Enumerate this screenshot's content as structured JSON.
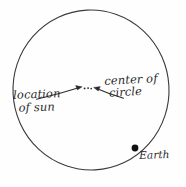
{
  "figure": {
    "background_color": "#fefefe",
    "ink_color": "#2b2b2b"
  },
  "circle": {
    "name": "orbit-circle",
    "center_x": 91,
    "center_y": 90,
    "radius_x": 78,
    "radius_y": 80,
    "stroke_color": "#3a3a3a",
    "stroke_width": 1.1
  },
  "center_marks": {
    "description": "small dots marking the geometric center / sun location",
    "dots": [
      {
        "x": 84.5,
        "y": 88.5,
        "r": 0.9
      },
      {
        "x": 88.0,
        "y": 88.2,
        "r": 0.9
      },
      {
        "x": 91.0,
        "y": 88.6,
        "r": 0.8
      }
    ]
  },
  "earth": {
    "dot_x": 135,
    "dot_y": 148,
    "dot_radius": 3.4,
    "dot_color": "#111111",
    "label": "Earth"
  },
  "labels": {
    "location_of_sun": {
      "line1": "location",
      "line2": "of sun"
    },
    "center_of_circle": {
      "line1": "center of",
      "line2": "circle"
    }
  },
  "arrows": [
    {
      "name": "arrow-from-location-of-sun",
      "from_x": 36,
      "from_y": 99,
      "to_x": 81,
      "to_y": 87,
      "points_to": "center dots"
    },
    {
      "name": "arrow-from-center-of-circle",
      "from_x": 123,
      "from_y": 98,
      "to_x": 94,
      "to_y": 88,
      "points_to": "center dots"
    }
  ]
}
